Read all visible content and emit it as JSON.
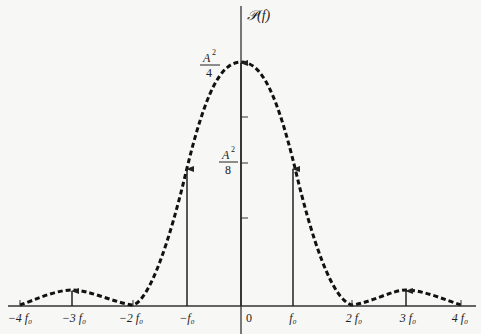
{
  "figure": {
    "y_axis_label": "𝒫(f)",
    "y_ticks": [
      {
        "num": "A",
        "exp": "2",
        "den": "4",
        "value": "A²/4"
      },
      {
        "num": "A",
        "exp": "2",
        "den": "8",
        "value": "A²/8"
      }
    ],
    "x_ticks": [
      "−4 f₀",
      "−3 f₀",
      "−2 f₀",
      "−f₀",
      "0",
      "f₀",
      "2 f₀",
      "3 f₀",
      "4 f₀"
    ],
    "envelope_style": "dashed",
    "impulses": [
      {
        "at": "−3f₀",
        "height": "small"
      },
      {
        "at": "−f₀",
        "height": "≈A²/8"
      },
      {
        "at": "0",
        "height": "A²/4"
      },
      {
        "at": "f₀",
        "height": "≈A²/8"
      },
      {
        "at": "3f₀",
        "height": "small"
      }
    ]
  }
}
